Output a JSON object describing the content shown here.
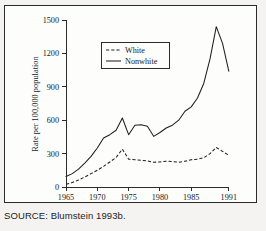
{
  "figure": {
    "source_note": "SOURCE: Blumstein 1993b."
  },
  "legend": {
    "entries": [
      {
        "label": "White",
        "style": "dashed"
      },
      {
        "label": "Nonwhite",
        "style": "solid"
      }
    ]
  },
  "axes": {
    "x_title": "Year",
    "y_title": "Rate per 100,000 population",
    "x_ticks": [
      "1965",
      "1970",
      "1975",
      "1980",
      "1985",
      "1991"
    ],
    "y_ticks": [
      "0",
      "300",
      "600",
      "900",
      "1200",
      "1500"
    ]
  },
  "chart_data": {
    "type": "line",
    "title": "",
    "subtitle": "",
    "xlabel": "Year",
    "ylabel": "Rate per 100,000 population",
    "xlim": [
      1965,
      1991
    ],
    "ylim": [
      0,
      1500
    ],
    "grid": false,
    "legend_position": "upper-left-inside",
    "x_tick_values": [
      1965,
      1970,
      1975,
      1980,
      1985,
      1991
    ],
    "y_tick_values": [
      0,
      300,
      600,
      900,
      1200,
      1500
    ],
    "x": [
      1965,
      1966,
      1967,
      1968,
      1969,
      1970,
      1971,
      1972,
      1973,
      1974,
      1975,
      1976,
      1977,
      1978,
      1979,
      1980,
      1981,
      1982,
      1983,
      1984,
      1985,
      1986,
      1987,
      1988,
      1989,
      1990,
      1991
    ],
    "series": [
      {
        "name": "White",
        "style": "dashed",
        "color": "#1f1f1f",
        "values": [
          25,
          40,
          62,
          90,
          120,
          150,
          185,
          225,
          265,
          340,
          250,
          245,
          240,
          235,
          222,
          225,
          232,
          228,
          222,
          232,
          245,
          250,
          262,
          300,
          355,
          320,
          285
        ]
      },
      {
        "name": "Nonwhite",
        "style": "solid",
        "color": "#1f1f1f",
        "values": [
          95,
          120,
          160,
          215,
          275,
          350,
          440,
          470,
          510,
          620,
          470,
          555,
          560,
          545,
          455,
          490,
          530,
          555,
          600,
          680,
          720,
          800,
          930,
          1150,
          1440,
          1290,
          1040
        ]
      }
    ],
    "annotations": [
      {
        "text": "SOURCE: Blumstein 1993b.",
        "position": "below-figure"
      }
    ]
  }
}
